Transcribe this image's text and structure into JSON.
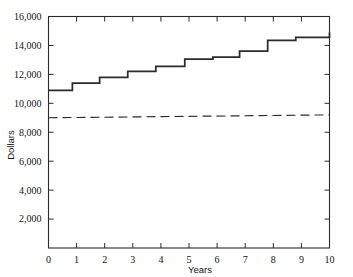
{
  "figure": {
    "clipped_title_fragment": "",
    "background": "#ffffff",
    "ink_color": "#2b2b2b"
  },
  "chart_data": {
    "type": "line",
    "title": "",
    "xlabel": "Years",
    "ylabel": "Dollars",
    "xlim": [
      0,
      10
    ],
    "ylim": [
      0,
      16000
    ],
    "grid": false,
    "legend": null,
    "x_ticks": [
      0,
      1,
      2,
      3,
      4,
      5,
      6,
      7,
      8,
      9,
      10
    ],
    "x_tick_labels": [
      "0",
      "1",
      "2",
      "3",
      "4",
      "5",
      "6",
      "7",
      "8",
      "9",
      "10"
    ],
    "y_ticks": [
      2000,
      4000,
      6000,
      8000,
      10000,
      12000,
      14000,
      16000
    ],
    "y_tick_labels": [
      "2,000",
      "4,000",
      "6,000",
      "8,000",
      "10,000",
      "12,000",
      "14,000",
      "16,000"
    ],
    "series": [
      {
        "name": "step-series",
        "style": "solid",
        "drawstyle": "steps-post",
        "color": "#2b2b2b",
        "width": 1.8,
        "step_edges": [
          0.0,
          0.85,
          1.82,
          2.82,
          3.82,
          4.85,
          5.85,
          6.8,
          7.8,
          8.8,
          10.0
        ],
        "x": [
          0,
          1,
          2,
          3,
          4,
          5,
          6,
          7,
          8,
          9,
          10
        ],
        "values": [
          10900,
          11400,
          11800,
          12200,
          12550,
          13050,
          13200,
          13600,
          14350,
          14550,
          14900
        ]
      },
      {
        "name": "dashed-baseline-series",
        "style": "dashed",
        "color": "#2b2b2b",
        "width": 1.2,
        "x": [
          0,
          10
        ],
        "values": [
          9000,
          9200
        ]
      }
    ]
  }
}
